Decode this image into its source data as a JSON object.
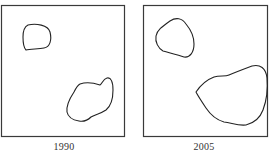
{
  "figure": {
    "panels": [
      {
        "id": "left",
        "caption": "1990",
        "frame": {
          "x": 1,
          "y": 5,
          "w": 123,
          "h": 131
        },
        "regions": [
          {
            "name": "small-region",
            "path": "M28,25 C36,23 48,25 50,32 C52,40 50,47 44,48 C38,49 30,49 26,50 C24,48 23,44 23,37 C23,31 24,27 28,25 Z"
          },
          {
            "name": "large-region",
            "path": "M80,84 C86,82 94,83 100,85 C102,84 103,79 107,78 C111,77 113,82 113,90 C113,100 111,106 106,110 C100,114 96,114 91,117 C88,120 84,122 79,121 C73,120 68,117 67,112 C66,105 70,98 74,92 C76,88 78,85 80,84 Z"
          }
        ]
      },
      {
        "id": "right",
        "caption": "2005",
        "frame": {
          "x": 143,
          "y": 5,
          "w": 124,
          "h": 131
        },
        "regions": [
          {
            "name": "small-region",
            "path": "M170,21 C176,17 182,18 186,24 C191,30 194,38 194,44 C194,52 190,58 184,57 C178,55 170,53 163,51 C158,48 155,42 156,36 C157,30 163,26 170,21 Z"
          },
          {
            "name": "large-region",
            "path": "M196,92 C200,86 206,80 214,77 C220,75 225,77 229,75 C236,72 244,69 252,66 C260,64 266,68 267,78 C268,90 266,102 263,110 C260,118 254,123 246,125 C238,126 232,123 224,122 C217,120 210,114 206,108 C202,102 198,96 196,92 Z"
          }
        ]
      }
    ],
    "stroke_color": "#222222",
    "frame_color": "#3a3a3a"
  }
}
